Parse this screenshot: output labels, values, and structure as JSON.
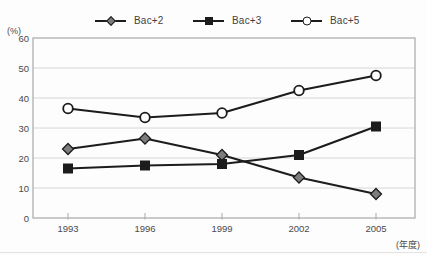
{
  "chart_data": {
    "type": "line",
    "title": "",
    "categories": [
      "1993",
      "1996",
      "1999",
      "2002",
      "2005"
    ],
    "series": [
      {
        "name": "Bac+2",
        "marker": "diamond",
        "marker_fill": "#7d7d7d",
        "values": [
          23,
          26.5,
          21,
          13.5,
          8
        ]
      },
      {
        "name": "Bac+3",
        "marker": "square",
        "marker_fill": "#1c1c1c",
        "values": [
          16.5,
          17.5,
          18,
          21,
          30.5
        ]
      },
      {
        "name": "Bac+5",
        "marker": "circle",
        "marker_fill": "#ffffff",
        "values": [
          36.5,
          33.5,
          35,
          42.5,
          47.5
        ]
      }
    ],
    "xlabel": "(年度)",
    "ylabel": "(%)",
    "ylim": [
      0,
      60
    ],
    "yticks": [
      0,
      10,
      20,
      30,
      40,
      50,
      60
    ],
    "grid": true,
    "legend_position": "top"
  },
  "colors": {
    "line": "#1c1c1c",
    "grid": "#d6d6d6",
    "frame": "#a9a9a9",
    "text": "#4a4a4a",
    "background": "#fdfdfd"
  }
}
